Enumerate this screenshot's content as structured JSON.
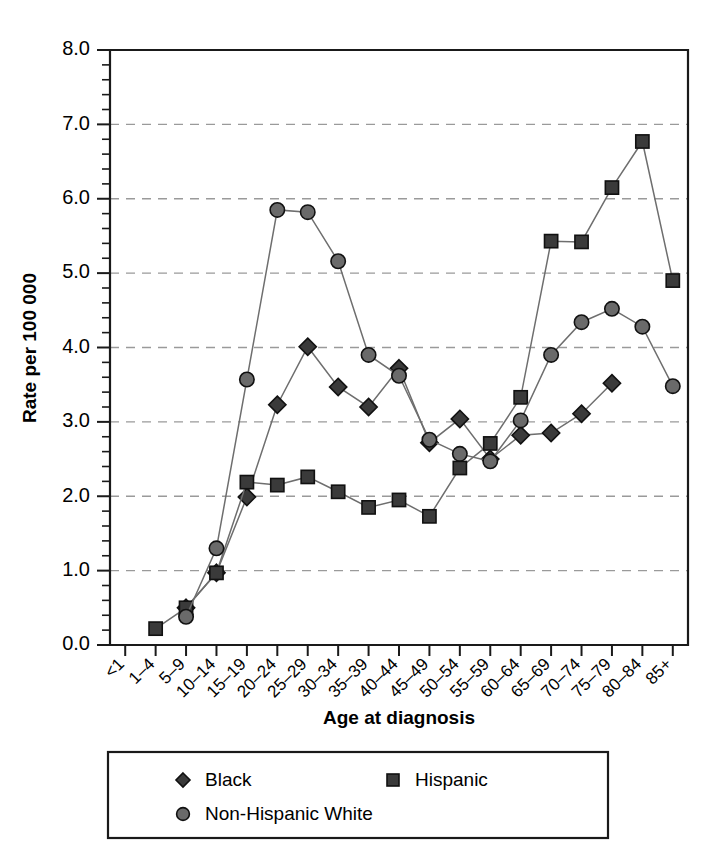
{
  "chart_data": {
    "type": "line",
    "title": "",
    "xlabel": "Age at diagnosis",
    "ylabel": "Rate per 100 000",
    "ylim": [
      0.0,
      8.0
    ],
    "ytick_labels": [
      "0.0",
      "1.0",
      "2.0",
      "3.0",
      "4.0",
      "5.0",
      "6.0",
      "7.0",
      "8.0"
    ],
    "ytick_values": [
      0,
      1,
      2,
      3,
      4,
      5,
      6,
      7,
      8
    ],
    "yminor_step": 0.2,
    "grid": "horizontal-dashed",
    "legend_position": "below-plot",
    "categories": [
      "<1",
      "1–4",
      "5–9",
      "10–14",
      "15–19",
      "20–24",
      "25–29",
      "30–34",
      "35–39",
      "40–44",
      "45–49",
      "50–54",
      "55–59",
      "60–64",
      "65–69",
      "70–74",
      "75–79",
      "80–84",
      "85+"
    ],
    "series": [
      {
        "name": "Black",
        "marker": "diamond",
        "color": "#3a3a3a",
        "values": [
          null,
          null,
          0.5,
          0.97,
          1.99,
          3.23,
          4.01,
          3.47,
          3.2,
          3.72,
          2.72,
          3.04,
          2.5,
          2.82,
          2.85,
          3.11,
          3.52,
          null,
          null
        ]
      },
      {
        "name": "Hispanic",
        "marker": "square",
        "color": "#4a4a4a",
        "values": [
          null,
          0.22,
          0.5,
          0.97,
          2.19,
          2.15,
          2.26,
          2.06,
          1.85,
          1.95,
          1.73,
          2.38,
          2.71,
          3.33,
          5.43,
          5.42,
          6.15,
          6.77,
          4.9
        ]
      },
      {
        "name": "Non-Hispanic White",
        "marker": "circle",
        "color": "#6a6a6a",
        "values": [
          null,
          null,
          0.38,
          1.3,
          3.57,
          5.85,
          5.82,
          5.16,
          3.9,
          3.62,
          2.76,
          2.57,
          2.47,
          3.02,
          3.9,
          4.34,
          4.52,
          4.28,
          3.48
        ]
      }
    ]
  },
  "legend": {
    "entries": [
      {
        "label": "Black",
        "marker": "diamond"
      },
      {
        "label": "Hispanic",
        "marker": "square"
      },
      {
        "label": "Non-Hispanic White",
        "marker": "circle"
      }
    ]
  }
}
